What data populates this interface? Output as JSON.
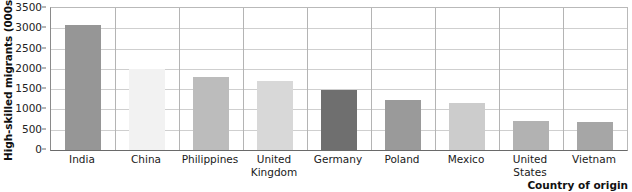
{
  "chart_data": {
    "type": "bar",
    "title": "",
    "xlabel": "Country of origin",
    "ylabel": "High-skilled migrants (000s)",
    "categories": [
      "India",
      "China",
      "Philippines",
      "United Kingdom",
      "Germany",
      "Poland",
      "Mexico",
      "United States",
      "Vietnam"
    ],
    "values": [
      3080,
      2000,
      1810,
      1700,
      1480,
      1230,
      1170,
      720,
      700
    ],
    "bar_colors": [
      "#969696",
      "#f2f2f2",
      "#bcbcbc",
      "#d8d8d8",
      "#6f6f6f",
      "#9a9a9a",
      "#cccccc",
      "#b2b2b2",
      "#a6a6a6"
    ],
    "ylim": [
      0,
      3500
    ],
    "ytick_step": 500,
    "ytick_labels": [
      "0",
      "500",
      "1000",
      "1500",
      "2000",
      "2500",
      "3000",
      "3500"
    ],
    "grid": "horizontal-and-category-separators",
    "legend": "none"
  },
  "axis": {
    "y_title": "High-skilled migrants (000s)",
    "x_title": "Country of origin"
  },
  "categories": [
    {
      "line1": "India",
      "line2": ""
    },
    {
      "line1": "China",
      "line2": ""
    },
    {
      "line1": "Philippines",
      "line2": ""
    },
    {
      "line1": "United",
      "line2": "Kingdom"
    },
    {
      "line1": "Germany",
      "line2": ""
    },
    {
      "line1": "Poland",
      "line2": ""
    },
    {
      "line1": "Mexico",
      "line2": ""
    },
    {
      "line1": "United",
      "line2": "States"
    },
    {
      "line1": "Vietnam",
      "line2": ""
    }
  ]
}
